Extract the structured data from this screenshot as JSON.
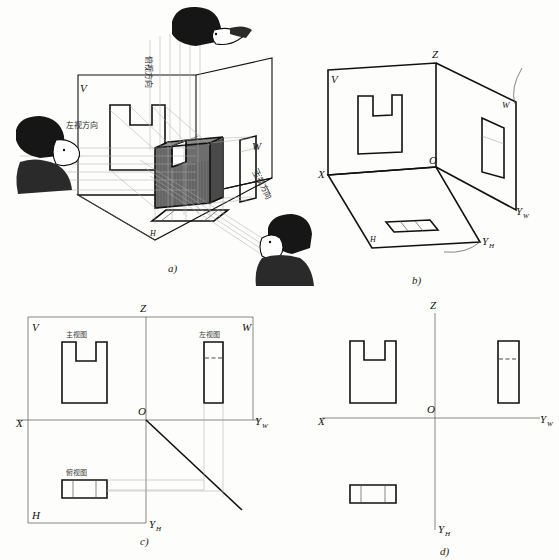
{
  "figure": {
    "panels": [
      {
        "id": "a",
        "caption": "a)",
        "desc": "pictorial of three mutually perpendicular projection planes with object and observers"
      },
      {
        "id": "b",
        "caption": "b)",
        "desc": "projection box with views drawn on V, H and W planes"
      },
      {
        "id": "c",
        "caption": "c)",
        "desc": "unfolded planes with view names and projection alignment lines"
      },
      {
        "id": "d",
        "caption": "d)",
        "desc": "final three-view layout with axes only"
      }
    ]
  },
  "panel_a": {
    "caption": "a)",
    "plane_labels": [
      {
        "name": "V",
        "text": "V"
      },
      {
        "name": "W",
        "text": "W"
      },
      {
        "name": "H",
        "text": "H"
      }
    ],
    "direction_labels": [
      {
        "name": "top-view-direction",
        "text": "俯视方向"
      },
      {
        "name": "left-view-direction",
        "text": "左视方向"
      },
      {
        "name": "front-view-direction",
        "text": "主视方向"
      }
    ],
    "observers": [
      "top-observer",
      "left-observer",
      "front-observer"
    ]
  },
  "panel_b": {
    "caption": "b)",
    "axis_labels": [
      {
        "name": "label-V",
        "text": "V"
      },
      {
        "name": "label-Z",
        "text": "Z"
      },
      {
        "name": "label-W",
        "text": "W"
      },
      {
        "name": "label-X",
        "text": "X"
      },
      {
        "name": "label-O",
        "text": "O"
      },
      {
        "name": "label-H",
        "text": "H"
      },
      {
        "name": "label-Yw",
        "text": "Y",
        "sub": "W"
      },
      {
        "name": "label-Yh",
        "text": "Y",
        "sub": "H"
      }
    ]
  },
  "panel_c": {
    "caption": "c)",
    "axis_labels": [
      {
        "name": "label-V",
        "text": "V"
      },
      {
        "name": "label-Z",
        "text": "Z"
      },
      {
        "name": "label-W",
        "text": "W"
      },
      {
        "name": "label-X",
        "text": "X"
      },
      {
        "name": "label-O",
        "text": "O"
      },
      {
        "name": "label-H",
        "text": "H"
      },
      {
        "name": "label-Yw",
        "text": "Y",
        "sub": "W"
      },
      {
        "name": "label-Yh",
        "text": "Y",
        "sub": "H"
      }
    ],
    "view_names": [
      {
        "name": "front-view-name",
        "text": "主视图"
      },
      {
        "name": "left-view-name",
        "text": "左视图"
      },
      {
        "name": "top-view-name",
        "text": "俯视图"
      }
    ]
  },
  "panel_d": {
    "caption": "d)",
    "axis_labels": [
      {
        "name": "label-Z",
        "text": "Z"
      },
      {
        "name": "label-X",
        "text": "X"
      },
      {
        "name": "label-O",
        "text": "O"
      },
      {
        "name": "label-Yw",
        "text": "Y",
        "sub": "W"
      },
      {
        "name": "label-Yh",
        "text": "Y",
        "sub": "H"
      }
    ]
  },
  "colors": {
    "ink": "#111111",
    "thin_line": "#555555",
    "projection_line": "#aaaaaa",
    "shade": "#6e6e6e",
    "paper": "#fdfdfb"
  }
}
